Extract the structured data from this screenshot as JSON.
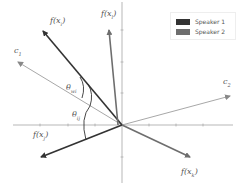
{
  "legend": {
    "items": [
      {
        "label": "Speaker 1",
        "color": "#333333"
      },
      {
        "label": "Speaker 2",
        "color": "#6e6e6e"
      }
    ]
  },
  "labels": {
    "f_xi": {
      "base": "f(x",
      "sub": "i",
      "end": ")"
    },
    "f_xl": {
      "base": "f(x",
      "sub": "l",
      "end": ")"
    },
    "f_xj": {
      "base": "f(x",
      "sub": "j",
      "end": ")"
    },
    "f_xk": {
      "base": "f(x",
      "sub": "k",
      "end": ")"
    },
    "c1": {
      "base": "c",
      "sub": "1",
      "end": ""
    },
    "c2": {
      "base": "c",
      "sub": "2",
      "end": ""
    },
    "theta_wi": {
      "base": "θ",
      "sub": "wi",
      "end": ""
    },
    "theta_ij": {
      "base": "θ",
      "sub": "ij",
      "end": ""
    }
  },
  "colors": {
    "speaker1": "#333333",
    "speaker2": "#6e6e6e",
    "centroid": "#a8a8a8",
    "axis": "#9a9a9a"
  }
}
